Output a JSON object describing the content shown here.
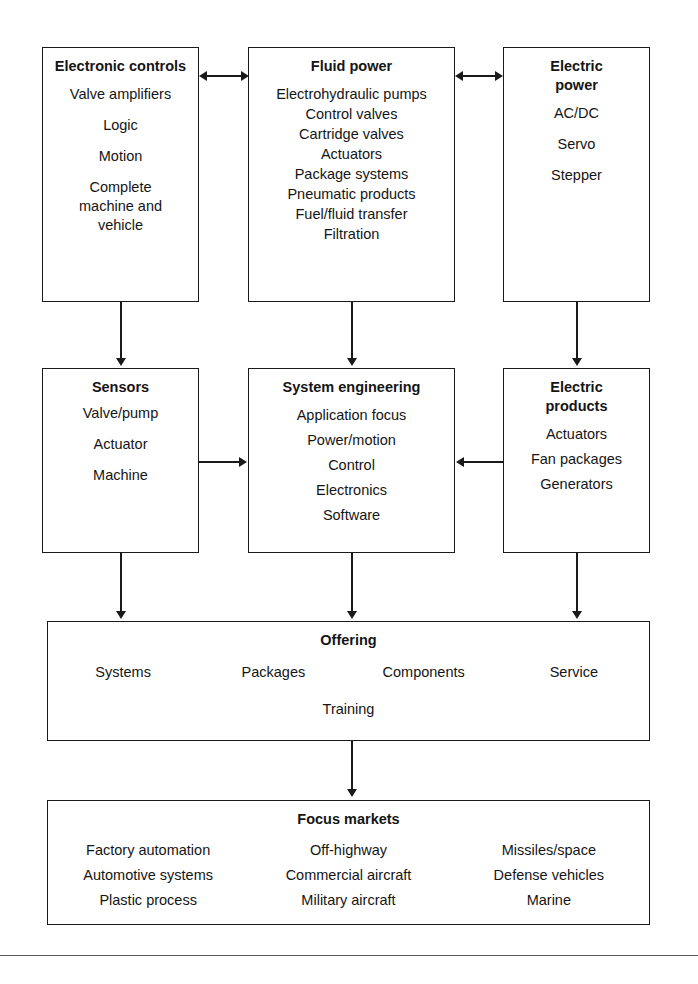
{
  "diagram": {
    "title_clipped": "",
    "boxes": {
      "electronic_controls": {
        "heading": "Electronic controls",
        "items": [
          "Valve amplifiers",
          "Logic",
          "Motion",
          "Complete machine and vehicle"
        ]
      },
      "fluid_power": {
        "heading": "Fluid power",
        "items": [
          "Electrohydraulic pumps",
          "Control valves",
          "Cartridge valves",
          "Actuators",
          "Package systems",
          "Pneumatic products",
          "Fuel/fluid transfer",
          "Filtration"
        ]
      },
      "electric_power": {
        "heading": "Electric power",
        "items": [
          "AC/DC",
          "Servo",
          "Stepper"
        ]
      },
      "sensors": {
        "heading": "Sensors",
        "items": [
          "Valve/pump",
          "Actuator",
          "Machine"
        ]
      },
      "system_engineering": {
        "heading": "System engineering",
        "items": [
          "Application focus",
          "Power/motion",
          "Control",
          "Electronics",
          "Software"
        ]
      },
      "electric_products": {
        "heading": "Electric products",
        "items": [
          "Actuators",
          "Fan packages",
          "Generators"
        ]
      },
      "offering": {
        "heading": "Offering",
        "row": [
          "Systems",
          "Packages",
          "Components",
          "Service"
        ],
        "center": "Training"
      },
      "focus_markets": {
        "heading": "Focus markets",
        "columns": [
          [
            "Factory automation",
            "Automotive systems",
            "Plastic process"
          ],
          [
            "Off-highway",
            "Commercial aircraft",
            "Military aircraft"
          ],
          [
            "Missiles/space",
            "Defense vehicles",
            "Marine"
          ]
        ]
      }
    },
    "connectors": [
      {
        "name": "electronic-controls-to-fluid-power",
        "type": "bidirectional-horizontal"
      },
      {
        "name": "fluid-power-to-electric-power",
        "type": "bidirectional-horizontal"
      },
      {
        "name": "electronic-controls-to-sensors",
        "type": "down"
      },
      {
        "name": "fluid-power-to-system-engineering",
        "type": "down"
      },
      {
        "name": "electric-power-to-electric-products",
        "type": "down"
      },
      {
        "name": "sensors-to-system-engineering",
        "type": "right"
      },
      {
        "name": "electric-products-to-system-engineering",
        "type": "left"
      },
      {
        "name": "sensors-to-offering",
        "type": "down"
      },
      {
        "name": "system-engineering-to-offering",
        "type": "down"
      },
      {
        "name": "electric-products-to-offering",
        "type": "down"
      },
      {
        "name": "offering-to-focus-markets",
        "type": "down"
      }
    ],
    "colors": {
      "line": "#1a1a1a",
      "text": "#151515",
      "background": "#ffffff",
      "rule": "#5a5a5a"
    }
  }
}
